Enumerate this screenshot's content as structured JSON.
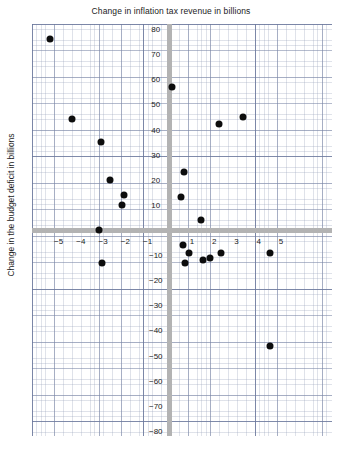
{
  "chart_data": {
    "type": "scatter",
    "title": "Change in inflation tax revenue in billions",
    "xlabel": "",
    "ylabel": "Change in the budget deficit in billions",
    "xlim": [
      -6.2,
      7.3
    ],
    "ylim": [
      -82,
      82
    ],
    "grid": true,
    "legend": null,
    "xticks": [
      -5,
      -4,
      -3,
      -2,
      -1,
      1,
      2,
      3,
      4,
      5
    ],
    "xtick_labels": [
      "−5",
      "−4",
      "−3",
      "−2",
      "−1",
      "1",
      "2",
      "3",
      "4",
      "5"
    ],
    "yticks": [
      80,
      70,
      60,
      50,
      40,
      30,
      20,
      10,
      -10,
      -20,
      -30,
      -40,
      -50,
      -60,
      -70,
      -80
    ],
    "ytick_labels": [
      "80",
      "70",
      "60",
      "50",
      "40",
      "30",
      "20",
      "10",
      "−10",
      "−20",
      "−30",
      "−40",
      "−50",
      "−60",
      "−70",
      "−80"
    ],
    "points": [
      {
        "x": -5.4,
        "y": 76
      },
      {
        "x": -4.4,
        "y": 44
      },
      {
        "x": -3.1,
        "y": 35
      },
      {
        "x": -2.7,
        "y": 20
      },
      {
        "x": -2.05,
        "y": 14
      },
      {
        "x": -2.15,
        "y": 10
      },
      {
        "x": -3.2,
        "y": 0
      },
      {
        "x": -3.05,
        "y": -13
      },
      {
        "x": 0.1,
        "y": 57
      },
      {
        "x": 2.2,
        "y": 42
      },
      {
        "x": 3.3,
        "y": 45
      },
      {
        "x": 0.65,
        "y": 23
      },
      {
        "x": 0.5,
        "y": 13
      },
      {
        "x": 1.4,
        "y": 4
      },
      {
        "x": 4.5,
        "y": -9
      },
      {
        "x": 0.6,
        "y": -6
      },
      {
        "x": 0.85,
        "y": -9
      },
      {
        "x": 0.7,
        "y": -13
      },
      {
        "x": 1.5,
        "y": -12
      },
      {
        "x": 1.8,
        "y": -11
      },
      {
        "x": 2.3,
        "y": -9
      },
      {
        "x": 4.5,
        "y": -46
      }
    ],
    "colors": {
      "marker": "#0d0d0d",
      "axis": "#b3b3b3",
      "grid": "#7884a5",
      "background": "#ffffff",
      "text": "#222222"
    }
  }
}
